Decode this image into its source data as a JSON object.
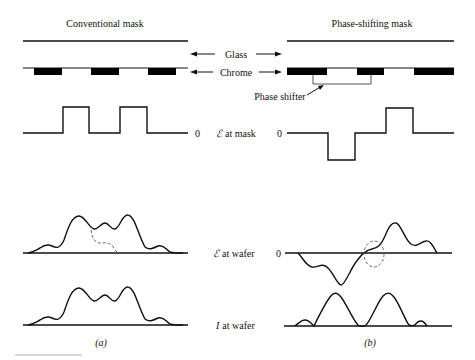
{
  "figure": {
    "left_panel": {
      "title": "Conventional mask",
      "caption": "(a)",
      "zero_label": "0"
    },
    "right_panel": {
      "title": "Phase-shifting mask",
      "caption": "(b)",
      "zero_label_mask": "0",
      "zero_label_wafer": "0"
    },
    "center_labels": {
      "glass": "Glass",
      "chrome": "Chrome",
      "e_at_mask_symbol": "ℰ",
      "e_at_mask_text": "at mask",
      "e_at_wafer_symbol": "ℰ",
      "e_at_wafer_text": "at wafer",
      "i_at_wafer_symbol": "I",
      "i_at_wafer_text": "at wafer"
    },
    "phase_shifter_label": "Phase shifter",
    "rows": [
      "Glass",
      "Chrome",
      "ℰ at mask",
      "ℰ at wafer",
      "I at wafer"
    ],
    "colors": {
      "ink": "#111111",
      "chrome": "#000000",
      "dashed": "#666666",
      "background": "#ffffff"
    }
  }
}
